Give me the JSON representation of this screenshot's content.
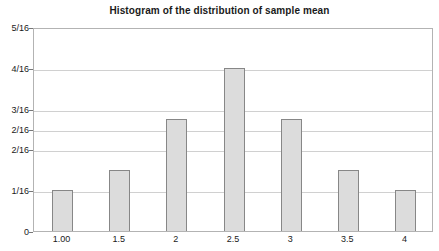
{
  "chart_data": {
    "type": "bar",
    "title": "Histogram of the distribution of sample mean",
    "xlabel": "",
    "ylabel": "",
    "categories": [
      "1.00",
      "1.5",
      "2",
      "2.5",
      "3",
      "3.5",
      "4"
    ],
    "values": [
      1,
      1.5,
      2.75,
      4,
      2.75,
      1.5,
      1
    ],
    "value_labels": [
      "1/16",
      "1.5/16",
      "2.75/16",
      "4/16",
      "2.75/16",
      "1.5/16",
      "1/16"
    ],
    "ylim": [
      0,
      5
    ],
    "ytick_values": [
      0,
      1,
      2,
      3,
      4,
      5
    ],
    "ytick_labels": [
      "0",
      "1/16",
      "2/16",
      "2/16",
      "3/16",
      "4/16",
      "5/16"
    ],
    "ytick_positions": [
      0,
      1,
      2,
      2.5,
      3,
      4,
      5
    ],
    "xtick_labels": [
      "1.00",
      "1.5",
      "2",
      "2.5",
      "3",
      "3.5",
      "4"
    ],
    "grid": true,
    "legend": null,
    "bar_fill_color": "#dcdcdc",
    "bar_border_color": "#878787",
    "gridline_color": "#d0d0d0",
    "axis_color": "#b3b3b3",
    "text_color": "#1a1a1a"
  }
}
